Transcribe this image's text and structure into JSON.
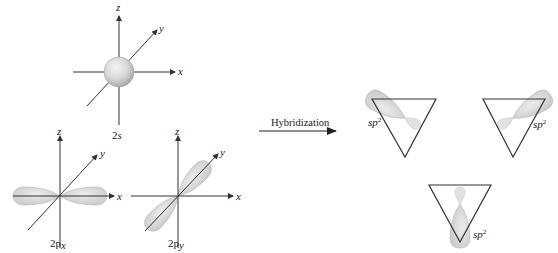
{
  "figure": {
    "colors": {
      "axis": "#333333",
      "orbital_fill": "#d9d9d9",
      "orbital_edge": "#b5b5b5",
      "background": "#ffffff"
    },
    "orbitals": [
      {
        "id": "2s",
        "label_main": "2",
        "label_sub": "s",
        "axes": {
          "x": "x",
          "y": "y",
          "z": "z"
        },
        "shape": "sphere"
      },
      {
        "id": "2px",
        "label_main": "2p",
        "label_sub": "x",
        "axes": {
          "x": "x",
          "y": "y",
          "z": "z"
        },
        "shape": "dumbbell-along-x"
      },
      {
        "id": "2py",
        "label_main": "2p",
        "label_sub": "y",
        "axes": {
          "x": "x",
          "y": "y",
          "z": "z"
        },
        "shape": "dumbbell-along-y"
      }
    ],
    "arrow": {
      "label": "Hybridization"
    },
    "hybrids": [
      {
        "label_main": "sp",
        "label_sup": "2",
        "position": "top-left"
      },
      {
        "label_main": "sp",
        "label_sup": "2",
        "position": "top-right"
      },
      {
        "label_main": "sp",
        "label_sup": "2",
        "position": "bottom"
      }
    ]
  }
}
